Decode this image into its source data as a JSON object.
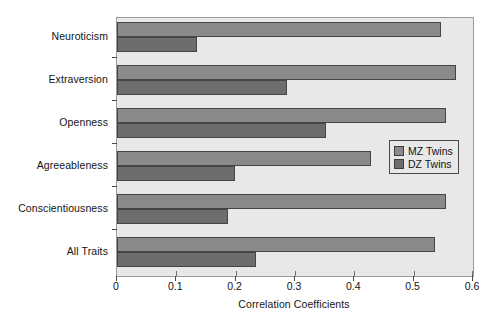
{
  "chart_data": {
    "type": "bar",
    "orientation": "horizontal",
    "title": "",
    "xlabel": "Correlation Coefficients",
    "ylabel": "",
    "xlim": [
      0,
      0.6
    ],
    "xticks": [
      "0",
      "0.1",
      "0.2",
      "0.3",
      "0.4",
      "0.5",
      "0.6"
    ],
    "xtick_values": [
      0,
      0.1,
      0.2,
      0.3,
      0.4,
      0.5,
      0.6
    ],
    "grid": false,
    "legend_position": "center-right",
    "categories": [
      "Neuroticism",
      "Extraversion",
      "Openness",
      "Agreeableness",
      "Conscientiousness",
      "All Traits"
    ],
    "series": [
      {
        "name": "MZ Twins",
        "color": "#8a8a8a",
        "values": [
          0.546,
          0.572,
          0.555,
          0.428,
          0.555,
          0.536
        ]
      },
      {
        "name": "DZ Twins",
        "color": "#6d6d6d",
        "values": [
          0.135,
          0.287,
          0.352,
          0.199,
          0.187,
          0.235
        ]
      }
    ]
  },
  "legend": {
    "entries": [
      {
        "label": "MZ Twins",
        "swatch": "mz"
      },
      {
        "label": "DZ Twins",
        "swatch": "dz"
      }
    ]
  },
  "colors": {
    "plot_background": "#e8e8e8",
    "frame": "#9a9a9a",
    "mz_bar": "#8a8a8a",
    "dz_bar": "#6d6d6d",
    "text": "#141414"
  }
}
